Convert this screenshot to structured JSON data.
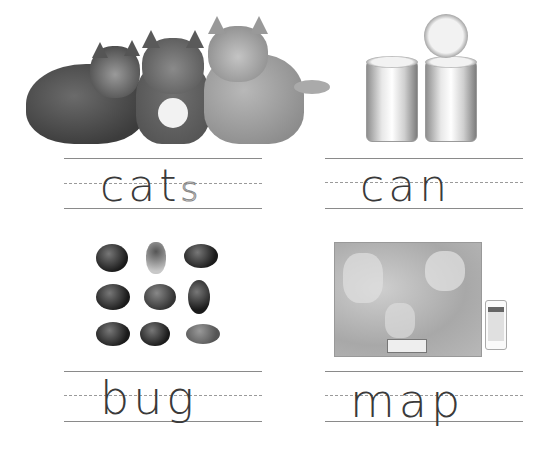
{
  "worksheet": {
    "cards": [
      {
        "id": "cats",
        "word_solid": "cat",
        "word_traced": "s",
        "image": "three cats lying down",
        "image_icon": "cats-photo-icon"
      },
      {
        "id": "can",
        "word_solid": "can",
        "word_traced": "",
        "image": "two tin cans with one lid",
        "image_icon": "tin-can-icon"
      },
      {
        "id": "bug",
        "word_solid": "bug",
        "word_traced": "",
        "image": "grid of nine insects",
        "image_icon": "insects-icon"
      },
      {
        "id": "map",
        "word_solid": "map",
        "word_traced": "",
        "image": "world map and phone map app",
        "image_icon": "world-map-icon"
      }
    ]
  },
  "colors": {
    "ink": "#3a3a3a",
    "rule": "#8a8a8a",
    "dash": "#9a9a9a",
    "background": "#ffffff"
  }
}
